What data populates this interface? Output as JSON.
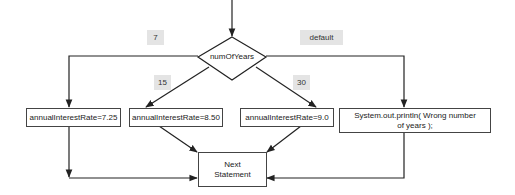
{
  "diagram": {
    "type": "flowchart",
    "decision": {
      "label": "numOfYears"
    },
    "branch_labels": [
      {
        "id": "case-7",
        "label": "7"
      },
      {
        "id": "case-15",
        "label": "15"
      },
      {
        "id": "case-30",
        "label": "30"
      },
      {
        "id": "case-default",
        "label": "default"
      }
    ],
    "actions": [
      {
        "id": "rate-7",
        "label": "annualInterestRate=7.25"
      },
      {
        "id": "rate-15",
        "label": "annualInterestRate=8.50"
      },
      {
        "id": "rate-30",
        "label": "annualInterestRate=9.0"
      },
      {
        "id": "error",
        "label_line1": "System.out.println( Wrong number",
        "label_line2": "of  years );"
      }
    ],
    "next": {
      "label_line1": "Next",
      "label_line2": "Statement"
    },
    "colors": {
      "line": "#222222",
      "label_bg": "#e4e4e4",
      "box_border": "#444444"
    }
  }
}
